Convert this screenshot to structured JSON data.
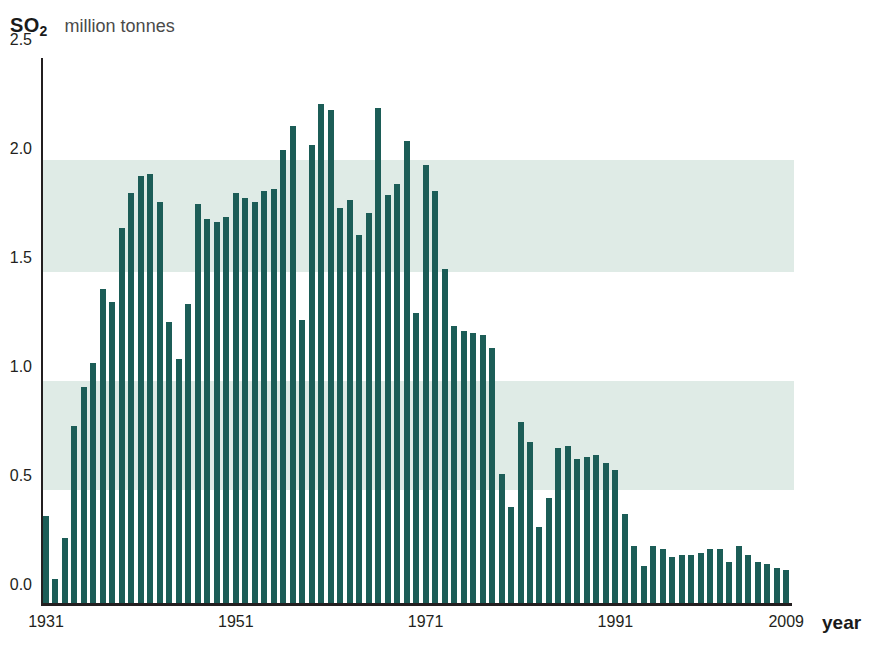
{
  "header": {
    "series_symbol": "SO",
    "series_subscript": "2",
    "unit_label": "million tonnes"
  },
  "axis": {
    "x_title": "year",
    "y_ticks": [
      "0.0",
      "0.5",
      "1.0",
      "1.5",
      "2.0",
      "2.5"
    ],
    "x_ticks": [
      "1931",
      "1951",
      "1971",
      "1991",
      "2009"
    ]
  },
  "colors": {
    "bar": "#1c5d57",
    "band": "#dfebe6",
    "axis": "#231f20",
    "text": "#231f20",
    "unit_text": "#4a4a4a",
    "background": "#ffffff"
  },
  "bands": [
    {
      "from": 0.52,
      "to": 1.02
    },
    {
      "from": 1.52,
      "to": 2.03
    }
  ],
  "chart_data": {
    "type": "bar",
    "title": "SO2 million tonnes",
    "xlabel": "year",
    "ylabel": "million tonnes",
    "ylim": [
      0.0,
      2.5
    ],
    "xlim": [
      1931,
      2009
    ],
    "grid": false,
    "legend": false,
    "ytick_values": [
      0.0,
      0.5,
      1.0,
      1.5,
      2.0,
      2.5
    ],
    "xtick_values": [
      1931,
      1951,
      1971,
      1991,
      2009
    ],
    "categories": [
      1931,
      1932,
      1933,
      1934,
      1935,
      1936,
      1937,
      1938,
      1939,
      1940,
      1941,
      1942,
      1943,
      1944,
      1945,
      1946,
      1947,
      1948,
      1949,
      1950,
      1951,
      1952,
      1953,
      1954,
      1955,
      1956,
      1957,
      1958,
      1959,
      1960,
      1961,
      1962,
      1963,
      1964,
      1965,
      1966,
      1967,
      1968,
      1969,
      1970,
      1971,
      1972,
      1973,
      1974,
      1975,
      1976,
      1977,
      1978,
      1979,
      1980,
      1981,
      1982,
      1983,
      1984,
      1985,
      1986,
      1987,
      1988,
      1989,
      1990,
      1991,
      1992,
      1993,
      1994,
      1995,
      1996,
      1997,
      1998,
      1999,
      2000,
      2001,
      2002,
      2003,
      2004,
      2005,
      2006,
      2007,
      2008,
      2009
    ],
    "values": [
      0.4,
      0.11,
      0.3,
      0.81,
      0.99,
      1.1,
      1.44,
      1.38,
      1.72,
      1.88,
      1.96,
      1.97,
      1.84,
      1.29,
      1.12,
      1.37,
      1.83,
      1.76,
      1.75,
      1.77,
      1.88,
      1.86,
      1.84,
      1.89,
      1.9,
      2.08,
      2.19,
      1.3,
      2.1,
      2.29,
      2.26,
      1.81,
      1.85,
      1.69,
      1.79,
      2.27,
      1.87,
      1.92,
      2.12,
      1.33,
      2.01,
      1.89,
      1.53,
      1.27,
      1.25,
      1.24,
      1.23,
      1.17,
      0.59,
      0.44,
      0.83,
      0.74,
      0.35,
      0.48,
      0.71,
      0.72,
      0.66,
      0.67,
      0.68,
      0.64,
      0.61,
      0.41,
      0.26,
      0.17,
      0.26,
      0.25,
      0.21,
      0.22,
      0.22,
      0.23,
      0.25,
      0.25,
      0.19,
      0.26,
      0.22,
      0.19,
      0.18,
      0.16,
      0.15
    ]
  }
}
